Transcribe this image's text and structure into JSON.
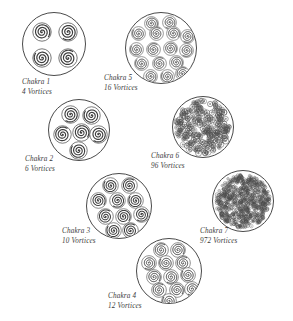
{
  "figure": {
    "background_color": "#ffffff",
    "ink_color": "#4a4a4a",
    "caption_color": "#3a3a3a"
  },
  "chakras": [
    {
      "id": "chakra-1",
      "name": "Chakra 1",
      "vortices_label": "4 Vortices",
      "vortex_count": 4,
      "render": "spirals",
      "disc": {
        "x": 22,
        "y": 12,
        "size": 64
      },
      "caption": {
        "x": 22,
        "y": 78
      },
      "vortex_size": 20,
      "positions": [
        [
          0.3,
          0.3
        ],
        [
          0.7,
          0.3
        ],
        [
          0.3,
          0.7
        ],
        [
          0.7,
          0.7
        ]
      ]
    },
    {
      "id": "chakra-2",
      "name": "Chakra 2",
      "vortices_label": "6 Vortices",
      "vortex_count": 6,
      "render": "spirals",
      "disc": {
        "x": 48,
        "y": 99,
        "size": 62
      },
      "caption": {
        "x": 25,
        "y": 155
      },
      "vortex_size": 19,
      "positions": [
        [
          0.34,
          0.24
        ],
        [
          0.68,
          0.25
        ],
        [
          0.22,
          0.55
        ],
        [
          0.52,
          0.52
        ],
        [
          0.8,
          0.55
        ],
        [
          0.47,
          0.82
        ]
      ]
    },
    {
      "id": "chakra-3",
      "name": "Chakra 3",
      "vortices_label": "10 Vortices",
      "vortex_count": 10,
      "render": "spirals",
      "disc": {
        "x": 86,
        "y": 173,
        "size": 66
      },
      "caption": {
        "x": 62,
        "y": 227
      },
      "vortex_size": 17,
      "positions": [
        [
          0.36,
          0.18
        ],
        [
          0.64,
          0.18
        ],
        [
          0.18,
          0.4
        ],
        [
          0.46,
          0.4
        ],
        [
          0.74,
          0.4
        ],
        [
          0.28,
          0.64
        ],
        [
          0.56,
          0.64
        ],
        [
          0.82,
          0.62
        ],
        [
          0.4,
          0.85
        ],
        [
          0.66,
          0.85
        ]
      ]
    },
    {
      "id": "chakra-4",
      "name": "Chakra 4",
      "vortices_label": "12 Vortices",
      "vortex_count": 12,
      "render": "spirals",
      "disc": {
        "x": 136,
        "y": 238,
        "size": 66
      },
      "caption": {
        "x": 108,
        "y": 292
      },
      "vortex_size": 16,
      "positions": [
        [
          0.36,
          0.16
        ],
        [
          0.62,
          0.16
        ],
        [
          0.18,
          0.36
        ],
        [
          0.44,
          0.36
        ],
        [
          0.7,
          0.36
        ],
        [
          0.26,
          0.57
        ],
        [
          0.52,
          0.57
        ],
        [
          0.78,
          0.55
        ],
        [
          0.34,
          0.78
        ],
        [
          0.6,
          0.78
        ],
        [
          0.84,
          0.75
        ],
        [
          0.48,
          0.94
        ]
      ]
    },
    {
      "id": "chakra-5",
      "name": "Chakra 5",
      "vortices_label": "16 Vortices",
      "vortex_count": 16,
      "render": "spirals",
      "disc": {
        "x": 125,
        "y": 12,
        "size": 72
      },
      "caption": {
        "x": 104,
        "y": 74
      },
      "vortex_size": 15,
      "positions": [
        [
          0.36,
          0.14
        ],
        [
          0.6,
          0.13
        ],
        [
          0.18,
          0.29
        ],
        [
          0.42,
          0.29
        ],
        [
          0.66,
          0.28
        ],
        [
          0.85,
          0.33
        ],
        [
          0.14,
          0.5
        ],
        [
          0.38,
          0.5
        ],
        [
          0.62,
          0.49
        ],
        [
          0.84,
          0.52
        ],
        [
          0.22,
          0.7
        ],
        [
          0.46,
          0.7
        ],
        [
          0.7,
          0.69
        ],
        [
          0.34,
          0.88
        ],
        [
          0.58,
          0.88
        ],
        [
          0.78,
          0.84
        ]
      ]
    },
    {
      "id": "chakra-6",
      "name": "Chakra 6",
      "vortices_label": "96 Vortices",
      "vortex_count": 96,
      "render": "speckle",
      "disc": {
        "x": 172,
        "y": 96,
        "size": 62
      },
      "caption": {
        "x": 151,
        "y": 152
      },
      "speckle": {
        "dot_count": 260,
        "dot_size": 2.6,
        "opacity": 0.8
      }
    },
    {
      "id": "chakra-7",
      "name": "Chakra 7",
      "vortices_label": "972 Vortices",
      "vortex_count": 972,
      "render": "speckle-dense",
      "disc": {
        "x": 212,
        "y": 170,
        "size": 62
      },
      "caption": {
        "x": 200,
        "y": 227
      },
      "speckle": {
        "dot_count": 620,
        "dot_size": 1.7,
        "opacity": 0.72
      }
    }
  ]
}
